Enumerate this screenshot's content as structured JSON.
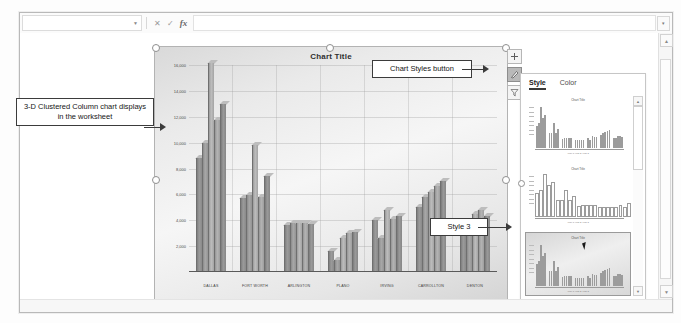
{
  "app": {
    "name_box_value": "",
    "formula_value": "",
    "cancel_icon": "close-icon",
    "enter_icon": "check-icon",
    "function_icon": "fx-icon",
    "collapse_icon": "chevron-down-icon"
  },
  "chart": {
    "title": "Chart Title",
    "side_buttons": [
      {
        "name": "chart-elements-button",
        "glyph": "+",
        "active": false
      },
      {
        "name": "chart-styles-button",
        "glyph": "brush",
        "active": true
      },
      {
        "name": "chart-filters-button",
        "glyph": "funnel",
        "active": false
      }
    ]
  },
  "chart_data": {
    "type": "bar",
    "title": "Chart Title",
    "xlabel": "",
    "ylabel": "",
    "ylim": [
      0,
      16000
    ],
    "yticks": [
      "16,000",
      "14,000",
      "12,000",
      "10,000",
      "8,000",
      "6,000",
      "4,000",
      "2,000"
    ],
    "grid": true,
    "legend_position": "bottom",
    "categories": [
      "DALLAS",
      "FORT WORTH",
      "ARLINGTON",
      "PLANO",
      "IRVING",
      "CARROLLTON",
      "DENTON"
    ],
    "series": [
      {
        "name": "Year 1",
        "values": [
          9000,
          5900,
          3800,
          1800,
          4200,
          5200,
          3900
        ]
      },
      {
        "name": "Year 2",
        "values": [
          10200,
          6100,
          4000,
          1100,
          2800,
          6000,
          4100
        ]
      },
      {
        "name": "Year 3",
        "values": [
          16400,
          10000,
          4000,
          2800,
          5000,
          6400,
          4700
        ]
      },
      {
        "name": "Year 4",
        "values": [
          12000,
          6000,
          4000,
          3200,
          4300,
          6800,
          5000
        ]
      },
      {
        "name": "Year 5",
        "values": [
          13200,
          7600,
          3900,
          3300,
          4500,
          7200,
          4500
        ]
      }
    ]
  },
  "callouts": [
    {
      "name": "callout-chart-displays",
      "text": "3-D Clustered Column chart displays in the worksheet"
    },
    {
      "name": "callout-chart-styles-button",
      "text": "Chart Styles button"
    },
    {
      "name": "callout-style-3",
      "text": "Style 3"
    }
  ],
  "pane": {
    "tabs": [
      {
        "label": "Style",
        "active": true
      },
      {
        "label": "Color",
        "active": false
      }
    ],
    "thumbnails": [
      {
        "name": "style-thumbnail-1",
        "title": "Chart Title",
        "legend": "Year 1 Year 2 Year 3",
        "selected": false,
        "outline": false
      },
      {
        "name": "style-thumbnail-2",
        "title": "Chart Title",
        "legend": "Year 1 Year 2 Year 3",
        "selected": false,
        "outline": true
      },
      {
        "name": "style-thumbnail-3",
        "title": "Chart Title",
        "legend": "Year 1 Year 2 Year 3",
        "selected": true,
        "outline": false
      }
    ],
    "tooltip": "Style 3",
    "scroll_up_icon": "caret-up-icon",
    "scroll_down_icon": "caret-down-icon"
  }
}
